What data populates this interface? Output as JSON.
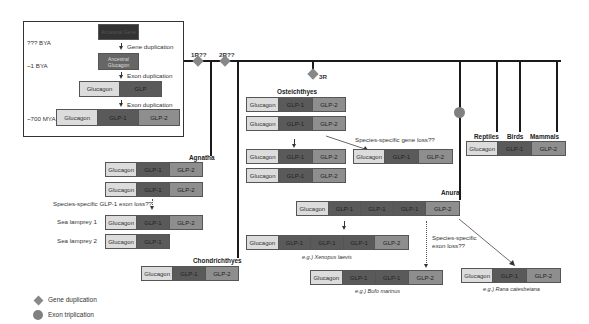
{
  "inset": {
    "time_labels": [
      "??? BYA",
      "~1 BYA",
      "~700 MYA"
    ],
    "ancestral_gene_label": "Ancestral Gene",
    "ancestral_glucagon_label": "Ancestral Glucagon",
    "step1": "Gene duplication",
    "step2": "Exon duplication",
    "step3": "Exon duplication",
    "stage3_segments": [
      "Glucagon",
      "GLP"
    ],
    "stage4_segments": [
      "Glucagon",
      "GLP-1",
      "GLP-2"
    ]
  },
  "tree": {
    "events": {
      "r1": "1R??",
      "r2": "2R??",
      "r3": "3R"
    },
    "clades": {
      "agnatha": "Agnatha",
      "chondrichthyes": "Chondrichthyes",
      "osteichthyes": "Osteichthyes",
      "anura": "Anura",
      "reptiles": "Reptiles",
      "birds": "Birds",
      "mammals": "Mammals"
    }
  },
  "agnatha": {
    "genes": [
      [
        "Glucagon",
        "GLP-1",
        "GLP-2"
      ],
      [
        "Glucagon",
        "GLP-1",
        "GLP-2"
      ]
    ],
    "loss_note": "Species-specific GLP-1 exon loss??",
    "lamprey1_label": "Sea lamprey 1",
    "lamprey1": [
      "Glucagon",
      "GLP-1",
      "GLP-2"
    ],
    "lamprey2_label": "Sea lamprey 2",
    "lamprey2": [
      "Glucagon",
      "GLP-1"
    ]
  },
  "chondrichthyes": {
    "gene": [
      "Glucagon",
      "GLP-1",
      "GLP-2"
    ]
  },
  "osteichthyes": {
    "genes_before": [
      [
        "Glucagon",
        "GLP-1",
        "GLP-2"
      ],
      [
        "Glucagon",
        "GLP-1",
        "GLP-2"
      ]
    ],
    "genes_after": [
      [
        "Glucagon",
        "GLP-1",
        "GLP-2"
      ],
      [
        "Glucagon",
        "GLP-1",
        "GLP-2"
      ],
      [
        "Glucagon",
        "GLP-1",
        "GLP-2"
      ],
      [
        "Glucagon",
        "GLP-1",
        "GLP-2"
      ]
    ],
    "loss_note": "Species-specific gene loss??",
    "loss_result": [
      "Glucagon",
      "GLP-1",
      "GLP-2"
    ]
  },
  "amniotes": {
    "gene": [
      "Glucagon",
      "GLP-1",
      "GLP-2"
    ]
  },
  "anura": {
    "ancestral": [
      "Glucagon",
      "GLP-1",
      "GLP-1",
      "GLP-1",
      "GLP-2"
    ],
    "xenopus": [
      "Glucagon",
      "GLP-1",
      "GLP-1",
      "GLP-1",
      "GLP-2"
    ],
    "xenopus_caption": "e.g.) Xenopus laevis",
    "bufo": [
      "Glucagon",
      "GLP-1",
      "GLP-1",
      "GLP-2"
    ],
    "bufo_caption": "e.g.) Bufo marinus",
    "rana": [
      "Glucagon",
      "GLP-1",
      "GLP-2"
    ],
    "rana_caption": "e.g.) Rana catesbeiana",
    "loss_note_line1": "Species-specific",
    "loss_note_line2": "exon loss??"
  },
  "legend": {
    "diamond": "Gene duplication",
    "circle": "Exon triplication"
  },
  "colors": {
    "glucagon": "#dcdcdc",
    "glp1": "#5a5a5a",
    "glp2": "#8e8e8e",
    "marker": "#808080",
    "line": "#1a1a1a"
  }
}
